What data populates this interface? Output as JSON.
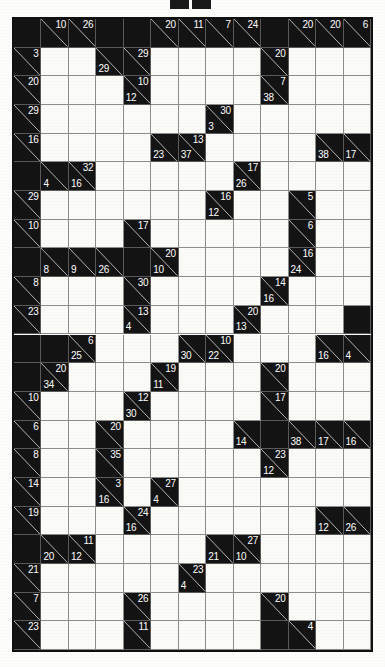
{
  "page": {
    "type": "kakuro",
    "rows": 22,
    "cols": 13,
    "colors": {
      "block": "#141414",
      "cell": "#fbfbf8",
      "grid_line": "#8d8d8d",
      "border": "#111111",
      "clue_text": "#ffffff",
      "page_background": "#fdfdfb"
    }
  },
  "header": {
    "marks": [
      "mark-left",
      "mark-right"
    ]
  },
  "grid": {
    "cells": [
      [
        {
          "t": "block"
        },
        {
          "t": "clue",
          "d": "10"
        },
        {
          "t": "clue",
          "d": "26"
        },
        {
          "t": "block"
        },
        {
          "t": "block"
        },
        {
          "t": "clue",
          "d": "20"
        },
        {
          "t": "clue",
          "d": "11"
        },
        {
          "t": "clue",
          "d": "7"
        },
        {
          "t": "clue",
          "d": "24"
        },
        {
          "t": "block"
        },
        {
          "t": "clue",
          "d": "20"
        },
        {
          "t": "clue",
          "d": "20"
        },
        {
          "t": "clue",
          "d": "6"
        }
      ],
      [
        {
          "t": "clue",
          "d": "3"
        },
        {
          "t": "open"
        },
        {
          "t": "open"
        },
        {
          "t": "clue",
          "a": "29"
        },
        {
          "t": "clue",
          "d": "29"
        },
        {
          "t": "open"
        },
        {
          "t": "open"
        },
        {
          "t": "open"
        },
        {
          "t": "open"
        },
        {
          "t": "clue",
          "d": "20"
        },
        {
          "t": "open"
        },
        {
          "t": "open"
        },
        {
          "t": "open"
        }
      ],
      [
        {
          "t": "clue",
          "d": "20"
        },
        {
          "t": "open"
        },
        {
          "t": "open"
        },
        {
          "t": "open"
        },
        {
          "t": "clue",
          "d": "10",
          "a": "12"
        },
        {
          "t": "open"
        },
        {
          "t": "open"
        },
        {
          "t": "open"
        },
        {
          "t": "open"
        },
        {
          "t": "clue",
          "d": "7",
          "a": "38"
        },
        {
          "t": "open"
        },
        {
          "t": "open"
        },
        {
          "t": "open"
        }
      ],
      [
        {
          "t": "clue",
          "d": "29"
        },
        {
          "t": "open"
        },
        {
          "t": "open"
        },
        {
          "t": "open"
        },
        {
          "t": "open"
        },
        {
          "t": "open"
        },
        {
          "t": "open"
        },
        {
          "t": "clue",
          "d": "30",
          "a": "3"
        },
        {
          "t": "open"
        },
        {
          "t": "open"
        },
        {
          "t": "open"
        },
        {
          "t": "open"
        },
        {
          "t": "open"
        }
      ],
      [
        {
          "t": "clue",
          "d": "16"
        },
        {
          "t": "open"
        },
        {
          "t": "open"
        },
        {
          "t": "open"
        },
        {
          "t": "open"
        },
        {
          "t": "clue",
          "a": "23"
        },
        {
          "t": "clue",
          "d": "13",
          "a": "37"
        },
        {
          "t": "open"
        },
        {
          "t": "open"
        },
        {
          "t": "open"
        },
        {
          "t": "open"
        },
        {
          "t": "clue",
          "a": "38"
        },
        {
          "t": "clue",
          "a": "17"
        }
      ],
      [
        {
          "t": "block"
        },
        {
          "t": "clue",
          "a": "4"
        },
        {
          "t": "clue",
          "d": "32",
          "a": "16"
        },
        {
          "t": "open"
        },
        {
          "t": "open"
        },
        {
          "t": "open"
        },
        {
          "t": "open"
        },
        {
          "t": "open"
        },
        {
          "t": "clue",
          "d": "17",
          "a": "26"
        },
        {
          "t": "open"
        },
        {
          "t": "open"
        },
        {
          "t": "open"
        },
        {
          "t": "open"
        }
      ],
      [
        {
          "t": "clue",
          "d": "29"
        },
        {
          "t": "open"
        },
        {
          "t": "open"
        },
        {
          "t": "open"
        },
        {
          "t": "open"
        },
        {
          "t": "open"
        },
        {
          "t": "open"
        },
        {
          "t": "clue",
          "d": "16",
          "a": "12"
        },
        {
          "t": "open"
        },
        {
          "t": "open"
        },
        {
          "t": "clue",
          "d": "5"
        },
        {
          "t": "open"
        },
        {
          "t": "open"
        }
      ],
      [
        {
          "t": "clue",
          "d": "10"
        },
        {
          "t": "open"
        },
        {
          "t": "open"
        },
        {
          "t": "open"
        },
        {
          "t": "clue",
          "d": "17"
        },
        {
          "t": "open"
        },
        {
          "t": "open"
        },
        {
          "t": "open"
        },
        {
          "t": "open"
        },
        {
          "t": "open"
        },
        {
          "t": "clue",
          "d": "6"
        },
        {
          "t": "open"
        },
        {
          "t": "open"
        }
      ],
      [
        {
          "t": "block"
        },
        {
          "t": "clue",
          "a": "8"
        },
        {
          "t": "clue",
          "a": "9"
        },
        {
          "t": "clue",
          "a": "26"
        },
        {
          "t": "block"
        },
        {
          "t": "clue",
          "d": "20",
          "a": "10"
        },
        {
          "t": "open"
        },
        {
          "t": "open"
        },
        {
          "t": "open"
        },
        {
          "t": "open"
        },
        {
          "t": "clue",
          "d": "16",
          "a": "24"
        },
        {
          "t": "open"
        },
        {
          "t": "open"
        }
      ],
      [
        {
          "t": "clue",
          "d": "8"
        },
        {
          "t": "open"
        },
        {
          "t": "open"
        },
        {
          "t": "open"
        },
        {
          "t": "clue",
          "d": "30"
        },
        {
          "t": "open"
        },
        {
          "t": "open"
        },
        {
          "t": "open"
        },
        {
          "t": "open"
        },
        {
          "t": "clue",
          "d": "14",
          "a": "16"
        },
        {
          "t": "open"
        },
        {
          "t": "open"
        },
        {
          "t": "open"
        }
      ],
      [
        {
          "t": "clue",
          "d": "23"
        },
        {
          "t": "open"
        },
        {
          "t": "open"
        },
        {
          "t": "open"
        },
        {
          "t": "clue",
          "d": "13",
          "a": "4"
        },
        {
          "t": "open"
        },
        {
          "t": "open"
        },
        {
          "t": "open"
        },
        {
          "t": "clue",
          "d": "20",
          "a": "13"
        },
        {
          "t": "open"
        },
        {
          "t": "open"
        },
        {
          "t": "open"
        },
        {
          "t": "block"
        }
      ],
      [
        {
          "t": "block"
        },
        {
          "t": "block"
        },
        {
          "t": "clue",
          "d": "6",
          "a": "25"
        },
        {
          "t": "open"
        },
        {
          "t": "open"
        },
        {
          "t": "open"
        },
        {
          "t": "clue",
          "a": "30"
        },
        {
          "t": "clue",
          "d": "10",
          "a": "22"
        },
        {
          "t": "open"
        },
        {
          "t": "open"
        },
        {
          "t": "open"
        },
        {
          "t": "clue",
          "a": "16"
        },
        {
          "t": "clue",
          "a": "4"
        }
      ],
      [
        {
          "t": "block"
        },
        {
          "t": "clue",
          "d": "20",
          "a": "34"
        },
        {
          "t": "open"
        },
        {
          "t": "open"
        },
        {
          "t": "open"
        },
        {
          "t": "clue",
          "d": "19",
          "a": "11"
        },
        {
          "t": "open"
        },
        {
          "t": "open"
        },
        {
          "t": "open"
        },
        {
          "t": "clue",
          "d": "20"
        },
        {
          "t": "open"
        },
        {
          "t": "open"
        },
        {
          "t": "open"
        }
      ],
      [
        {
          "t": "clue",
          "d": "10"
        },
        {
          "t": "open"
        },
        {
          "t": "open"
        },
        {
          "t": "open"
        },
        {
          "t": "clue",
          "d": "12",
          "a": "30"
        },
        {
          "t": "open"
        },
        {
          "t": "open"
        },
        {
          "t": "open"
        },
        {
          "t": "open"
        },
        {
          "t": "clue",
          "d": "17"
        },
        {
          "t": "open"
        },
        {
          "t": "open"
        },
        {
          "t": "open"
        }
      ],
      [
        {
          "t": "clue",
          "d": "6"
        },
        {
          "t": "open"
        },
        {
          "t": "open"
        },
        {
          "t": "clue",
          "d": "20"
        },
        {
          "t": "open"
        },
        {
          "t": "open"
        },
        {
          "t": "open"
        },
        {
          "t": "open"
        },
        {
          "t": "clue",
          "a": "14"
        },
        {
          "t": "block"
        },
        {
          "t": "clue",
          "a": "38"
        },
        {
          "t": "clue",
          "a": "17"
        },
        {
          "t": "clue",
          "a": "16"
        }
      ],
      [
        {
          "t": "clue",
          "d": "8"
        },
        {
          "t": "open"
        },
        {
          "t": "open"
        },
        {
          "t": "clue",
          "d": "35"
        },
        {
          "t": "open"
        },
        {
          "t": "open"
        },
        {
          "t": "open"
        },
        {
          "t": "open"
        },
        {
          "t": "open"
        },
        {
          "t": "clue",
          "d": "23",
          "a": "12"
        },
        {
          "t": "open"
        },
        {
          "t": "open"
        },
        {
          "t": "open"
        }
      ],
      [
        {
          "t": "clue",
          "d": "14"
        },
        {
          "t": "open"
        },
        {
          "t": "open"
        },
        {
          "t": "clue",
          "d": "3",
          "a": "16"
        },
        {
          "t": "open"
        },
        {
          "t": "clue",
          "d": "27",
          "a": "4"
        },
        {
          "t": "open"
        },
        {
          "t": "open"
        },
        {
          "t": "open"
        },
        {
          "t": "open"
        },
        {
          "t": "open"
        },
        {
          "t": "open"
        },
        {
          "t": "open"
        }
      ],
      [
        {
          "t": "clue",
          "d": "19"
        },
        {
          "t": "open"
        },
        {
          "t": "open"
        },
        {
          "t": "open"
        },
        {
          "t": "clue",
          "d": "24",
          "a": "16"
        },
        {
          "t": "open"
        },
        {
          "t": "open"
        },
        {
          "t": "open"
        },
        {
          "t": "open"
        },
        {
          "t": "open"
        },
        {
          "t": "open"
        },
        {
          "t": "clue",
          "a": "12"
        },
        {
          "t": "clue",
          "a": "26"
        }
      ],
      [
        {
          "t": "block"
        },
        {
          "t": "clue",
          "a": "20"
        },
        {
          "t": "clue",
          "d": "11",
          "a": "12"
        },
        {
          "t": "open"
        },
        {
          "t": "open"
        },
        {
          "t": "open"
        },
        {
          "t": "open"
        },
        {
          "t": "clue",
          "a": "21"
        },
        {
          "t": "clue",
          "d": "27",
          "a": "10"
        },
        {
          "t": "open"
        },
        {
          "t": "open"
        },
        {
          "t": "open"
        },
        {
          "t": "open"
        }
      ],
      [
        {
          "t": "clue",
          "d": "21"
        },
        {
          "t": "open"
        },
        {
          "t": "open"
        },
        {
          "t": "open"
        },
        {
          "t": "open"
        },
        {
          "t": "open"
        },
        {
          "t": "clue",
          "d": "23",
          "a": "4"
        },
        {
          "t": "open"
        },
        {
          "t": "open"
        },
        {
          "t": "open"
        },
        {
          "t": "open"
        },
        {
          "t": "open"
        },
        {
          "t": "open"
        }
      ],
      [
        {
          "t": "clue",
          "d": "7"
        },
        {
          "t": "open"
        },
        {
          "t": "open"
        },
        {
          "t": "open"
        },
        {
          "t": "clue",
          "d": "26"
        },
        {
          "t": "open"
        },
        {
          "t": "open"
        },
        {
          "t": "open"
        },
        {
          "t": "open"
        },
        {
          "t": "clue",
          "d": "20"
        },
        {
          "t": "open"
        },
        {
          "t": "open"
        },
        {
          "t": "open"
        }
      ],
      [
        {
          "t": "clue",
          "d": "23"
        },
        {
          "t": "open"
        },
        {
          "t": "open"
        },
        {
          "t": "open"
        },
        {
          "t": "clue",
          "d": "11"
        },
        {
          "t": "open"
        },
        {
          "t": "open"
        },
        {
          "t": "open"
        },
        {
          "t": "open"
        },
        {
          "t": "block"
        },
        {
          "t": "clue",
          "d": "4"
        },
        {
          "t": "open"
        },
        {
          "t": "open"
        }
      ]
    ]
  }
}
